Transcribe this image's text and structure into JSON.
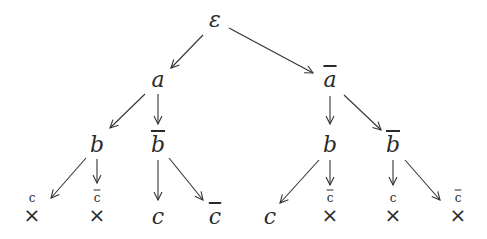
{
  "tree": {
    "root": {
      "label": "ε"
    },
    "level1": [
      {
        "label": "a",
        "negated": false
      },
      {
        "label": "a",
        "negated": true
      }
    ],
    "level2": [
      {
        "label": "b",
        "negated": false,
        "parent": "a"
      },
      {
        "label": "b",
        "negated": true,
        "parent": "a"
      },
      {
        "label": "b",
        "negated": false,
        "parent": "ā"
      },
      {
        "label": "b",
        "negated": true,
        "parent": "ā"
      }
    ],
    "leaves": [
      {
        "label": "c",
        "negated": false,
        "crossed": true,
        "cross": "×"
      },
      {
        "label": "c",
        "negated": true,
        "crossed": true,
        "cross": "×"
      },
      {
        "label": "c",
        "negated": false,
        "crossed": false
      },
      {
        "label": "c",
        "negated": true,
        "crossed": false
      },
      {
        "label": "c",
        "negated": false,
        "crossed": false
      },
      {
        "label": "c",
        "negated": true,
        "crossed": true,
        "cross": "×"
      },
      {
        "label": "c",
        "negated": false,
        "crossed": true,
        "cross": "×"
      },
      {
        "label": "c",
        "negated": true,
        "crossed": true,
        "cross": "×"
      }
    ]
  },
  "colors": {
    "line": "#333333",
    "text": "#2a2a2a",
    "background": "#ffffff"
  }
}
